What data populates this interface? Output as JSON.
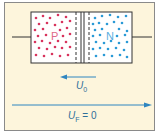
{
  "diagram": {
    "regions": [
      {
        "label": "P",
        "carrier_color": "#d8335d"
      },
      {
        "label": "N",
        "carrier_color": "#2a9ad6"
      }
    ],
    "arrows": [
      {
        "label_main": "U",
        "label_sub": "0",
        "direction": "left"
      },
      {
        "label_main": "U",
        "label_sub": "F",
        "suffix": " = 0",
        "direction": "right"
      }
    ],
    "colors": {
      "background": "#fdf5dc",
      "arrow": "#2f86c0",
      "wire": "#333333"
    }
  }
}
